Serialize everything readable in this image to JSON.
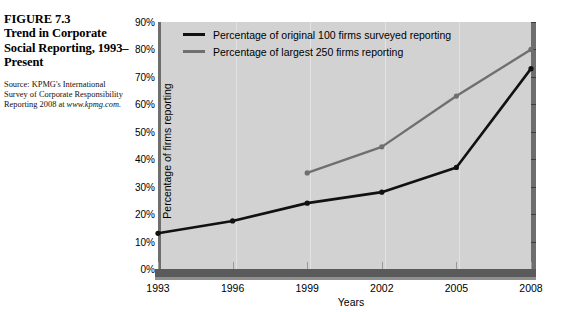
{
  "caption": {
    "figure_number": "FIGURE 7.3",
    "title": "Trend in Corporate Social Reporting, 1993–Present",
    "source_text": "Source: KPMG's International Survey of Corporate Responsibility Reporting 2008 at ",
    "source_url": "www.kpmg.com."
  },
  "chart_data": {
    "type": "line",
    "title": "Trend in Corporate Social Reporting, 1993–Present",
    "xlabel": "Years",
    "ylabel": "Percentage of firms reporting",
    "categories": [
      "1993",
      "1996",
      "1999",
      "2002",
      "2005",
      "2008"
    ],
    "x": [
      1993,
      1996,
      1999,
      2002,
      2005,
      2008
    ],
    "xlim": [
      1993,
      2008
    ],
    "ylim": [
      0,
      90
    ],
    "ytick_labels": [
      "0%",
      "10%",
      "20%",
      "30%",
      "40%",
      "50%",
      "60%",
      "70%",
      "80%",
      "90%"
    ],
    "ytick_values": [
      0,
      10,
      20,
      30,
      40,
      50,
      60,
      70,
      80,
      90
    ],
    "grid": false,
    "legend_position": "top-left",
    "series": [
      {
        "name": "Percentage of original 100 firms surveyed reporting",
        "color": "#111111",
        "x": [
          1993,
          1996,
          1999,
          2002,
          2005,
          2008
        ],
        "values": [
          13,
          17.5,
          24,
          28,
          37,
          73
        ]
      },
      {
        "name": "Percentage of largest 250 firms reporting",
        "color": "#6f6f6f",
        "x": [
          1999,
          2002,
          2005,
          2008
        ],
        "values": [
          35,
          44.5,
          63,
          80
        ]
      }
    ]
  },
  "colors": {
    "plot_background": "#d2d2d2",
    "axis_bar": "#5a5a5a",
    "series_black": "#111111",
    "series_gray": "#6f6f6f"
  }
}
